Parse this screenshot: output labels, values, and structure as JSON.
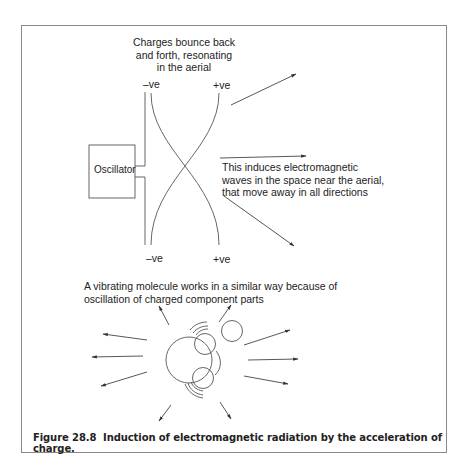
{
  "figure": {
    "top_annotation": [
      "Charges bounce back",
      "and forth, resonating",
      "in the aerial"
    ],
    "aerial_labels": {
      "top_left": "–ve",
      "top_right": "+ve",
      "bottom_left": "–ve",
      "bottom_right": "+ve"
    },
    "oscillator_label": "Oscillator",
    "wave_annotation": [
      "This induces electromagnetic",
      "waves in the space near the aerial,",
      "that move away in all directions"
    ],
    "molecule_annotation": [
      "A vibrating molecule works in a similar way because of",
      "oscillation of charged component parts"
    ],
    "caption_number": "Figure 28.8",
    "caption_text": "Induction of electromagnetic radiation by the acceleration of charge.",
    "colors": {
      "line": "#555555",
      "text": "#222222",
      "frame": "#8a8a8a"
    }
  }
}
